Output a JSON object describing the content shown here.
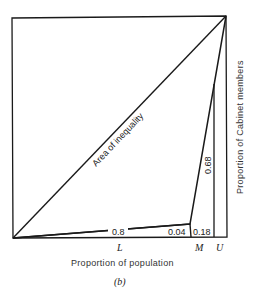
{
  "figure": {
    "caption": "(b)",
    "x_axis_label": "Proportion of population",
    "y_axis_label": "Proportion of Cabinet members",
    "diagonal_label": "Area of inequality",
    "points": {
      "L": "L",
      "M": "M",
      "U": "U"
    },
    "segment_values": {
      "lower_segment": "0.8",
      "middle_segment": "0.04",
      "upper_base": "0.18",
      "upper_rise": "0.68"
    },
    "colors": {
      "line": "#1a1a1a",
      "background": "#ffffff"
    }
  }
}
